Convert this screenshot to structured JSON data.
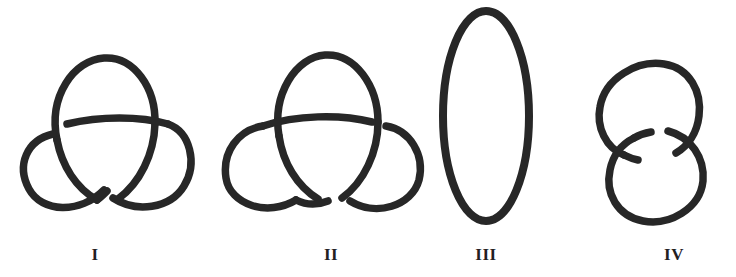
{
  "plate": {
    "background_color": "#ffffff",
    "stroke_color": "#272727",
    "width": 736,
    "height": 277,
    "figures": [
      {
        "label": "I",
        "name": "trefoil-knot-left",
        "type": "trefoil knot",
        "crossings": 3,
        "components": 1,
        "label_x": 95,
        "label_y": 246
      },
      {
        "label": "II",
        "name": "trefoil-knot-mirror",
        "type": "trefoil knot (mirror image)",
        "crossings": 3,
        "components": 1,
        "label_x": 331,
        "label_y": 246
      },
      {
        "label": "III",
        "name": "unknot-oval",
        "type": "unknot",
        "crossings": 0,
        "components": 1,
        "label_x": 486,
        "label_y": 246
      },
      {
        "label": "IV",
        "name": "hopf-link",
        "type": "Hopf link",
        "crossings": 2,
        "components": 2,
        "label_x": 674,
        "label_y": 246
      }
    ]
  }
}
